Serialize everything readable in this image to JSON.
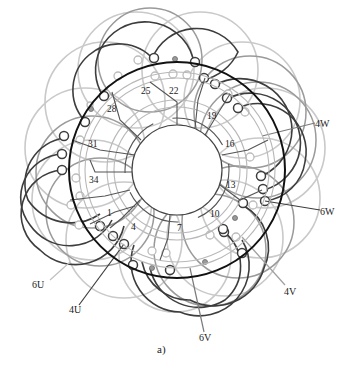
{
  "figure": {
    "caption": "a)",
    "center": [
      177,
      170
    ],
    "stator_radius": 108,
    "bore_radius": 45,
    "colors": {
      "dark": "#3a3a3a",
      "mid": "#8a8a8a",
      "light": "#c4c4c4",
      "stator": "#111111"
    }
  },
  "slots": [
    {
      "label": "25",
      "x": 141,
      "y": 87
    },
    {
      "label": "22",
      "x": 169,
      "y": 87
    },
    {
      "label": "28",
      "x": 107,
      "y": 105
    },
    {
      "label": "19",
      "x": 207,
      "y": 112
    },
    {
      "label": "31",
      "x": 88,
      "y": 140
    },
    {
      "label": "16",
      "x": 225,
      "y": 140
    },
    {
      "label": "34",
      "x": 89,
      "y": 176
    },
    {
      "label": "13",
      "x": 226,
      "y": 181
    },
    {
      "label": "1",
      "x": 107,
      "y": 209
    },
    {
      "label": "10",
      "x": 210,
      "y": 210
    },
    {
      "label": "4",
      "x": 131,
      "y": 223
    },
    {
      "label": "7",
      "x": 177,
      "y": 224
    }
  ],
  "terminals": [
    {
      "label": "4W",
      "x": 315,
      "y": 119
    },
    {
      "label": "6W",
      "x": 320,
      "y": 207
    },
    {
      "label": "4V",
      "x": 284,
      "y": 287
    },
    {
      "label": "6V",
      "x": 199,
      "y": 333
    },
    {
      "label": "6U",
      "x": 32,
      "y": 280
    },
    {
      "label": "4U",
      "x": 69,
      "y": 305
    }
  ]
}
